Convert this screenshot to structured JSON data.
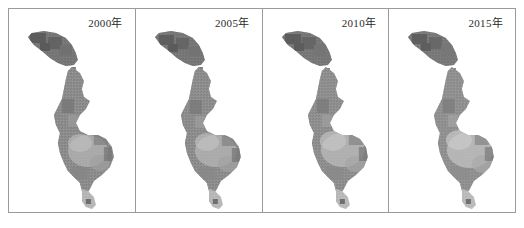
{
  "figure": {
    "title": "",
    "border_color": "#9b9b9b",
    "background_color": "#ffffff",
    "panel_count": 4
  },
  "panels": [
    {
      "label": "2000年",
      "year": "2000",
      "map_name": "grayscale-raster-map"
    },
    {
      "label": "2005年",
      "year": "2005",
      "map_name": "grayscale-raster-map"
    },
    {
      "label": "2010年",
      "year": "2010",
      "map_name": "grayscale-raster-map"
    },
    {
      "label": "2015年",
      "year": "2015",
      "map_name": "grayscale-raster-map"
    }
  ],
  "map": {
    "description": "elongated north-south study-area raster",
    "regions": {
      "north_blob": "dark dense cluster at upper left",
      "connector": "thin broken dotted chain",
      "central_body": "broad mottled mid-gray body",
      "south_tail": "light tapering southern tail"
    },
    "tones": {
      "darkest": "#5e5e5e",
      "dark": "#737373",
      "mid": "#8c8c8c",
      "light": "#a8a8a8",
      "lightest": "#c9c9c9"
    }
  }
}
